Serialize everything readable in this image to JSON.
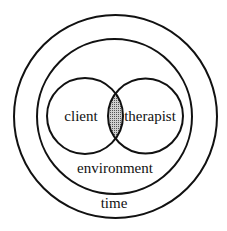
{
  "diagram": {
    "type": "nested-circles-venn",
    "labels": {
      "client": "client",
      "therapist": "therapist",
      "environment": "environment",
      "time": "time"
    },
    "colors": {
      "stroke": "#111111",
      "background": "#ffffff",
      "overlap_fill": "#9a9a9a"
    }
  }
}
